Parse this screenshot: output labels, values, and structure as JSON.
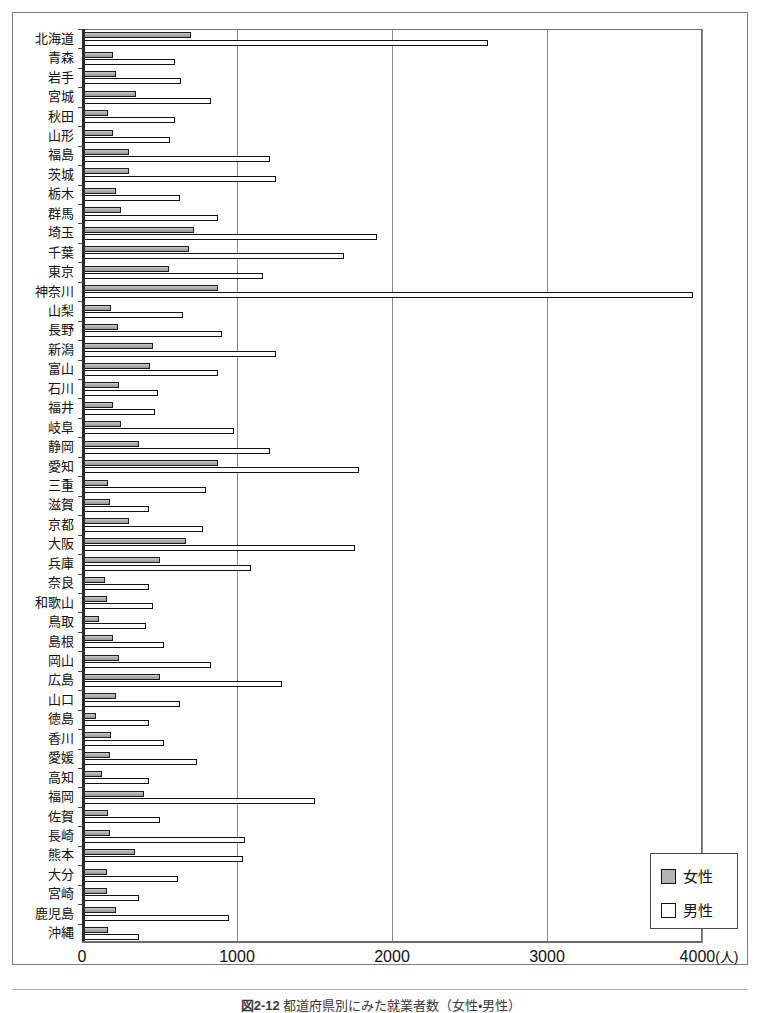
{
  "figure": {
    "caption_prefix": "図2-12",
    "caption_text": "都道府県別にみた就業者数（女性・男性）"
  },
  "legend": {
    "position": "bottom-right",
    "items": [
      {
        "label": "女性",
        "swatch": "female-swatch",
        "color": "#b3b3b3"
      },
      {
        "label": "男性",
        "swatch": "male-swatch",
        "color": "#ffffff"
      }
    ]
  },
  "axis": {
    "x_ticks": [
      "0",
      "1000",
      "2000",
      "3000",
      "4000"
    ],
    "x_unit": "(人)",
    "x_min": 0,
    "x_max": 4000,
    "grid": true
  },
  "chart_data": {
    "type": "bar",
    "orientation": "horizontal",
    "title": "",
    "xlabel": "(人)",
    "ylabel": "",
    "xlim": [
      0,
      4000
    ],
    "grid": true,
    "legend_position": "bottom-right",
    "categories": [
      "北海道",
      "青森",
      "岩手",
      "宮城",
      "秋田",
      "山形",
      "福島",
      "茨城",
      "栃木",
      "群馬",
      "埼玉",
      "千葉",
      "東京",
      "神奈川",
      "山梨",
      "長野",
      "新潟",
      "富山",
      "石川",
      "福井",
      "岐阜",
      "静岡",
      "愛知",
      "三重",
      "滋賀",
      "京都",
      "大阪",
      "兵庫",
      "奈良",
      "和歌山",
      "鳥取",
      "島根",
      "岡山",
      "広島",
      "山口",
      "徳島",
      "香川",
      "愛媛",
      "高知",
      "福岡",
      "佐賀",
      "長崎",
      "熊本",
      "大分",
      "宮崎",
      "鹿児島",
      "沖縄"
    ],
    "series": [
      {
        "name": "女性",
        "color": "#b3b3b3",
        "values": [
          700,
          200,
          220,
          350,
          170,
          200,
          300,
          300,
          220,
          250,
          720,
          690,
          560,
          880,
          190,
          230,
          460,
          440,
          240,
          200,
          250,
          370,
          880,
          170,
          180,
          300,
          670,
          500,
          150,
          160,
          110,
          200,
          240,
          500,
          220,
          90,
          190,
          180,
          130,
          400,
          170,
          180,
          340,
          160,
          160,
          220,
          170
        ]
      },
      {
        "name": "男性",
        "color": "#ffffff",
        "values": [
          2620,
          600,
          640,
          830,
          600,
          570,
          1210,
          1250,
          630,
          880,
          1900,
          1690,
          1170,
          3940,
          650,
          900,
          1250,
          880,
          490,
          470,
          980,
          1210,
          1790,
          800,
          430,
          780,
          1760,
          1090,
          430,
          460,
          410,
          530,
          830,
          1290,
          630,
          430,
          530,
          740,
          430,
          1500,
          500,
          1050,
          1040,
          620,
          370,
          950,
          370
        ]
      }
    ]
  }
}
